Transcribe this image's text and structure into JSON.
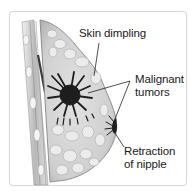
{
  "diagram": {
    "labels": {
      "skin_dimpling": "Skin dimpling",
      "malignant_line1": "Malignant",
      "malignant_line2": "tumors",
      "retraction_line1": "Retraction",
      "retraction_line2": "of nipple"
    },
    "colors": {
      "frame_border": "#d6d6d6",
      "tissue_light": "#e8e8e8",
      "tissue_mid": "#bdbdbd",
      "tumor": "#1e1e1e",
      "leader_line": "#222222",
      "text": "#1a1a1a"
    }
  }
}
